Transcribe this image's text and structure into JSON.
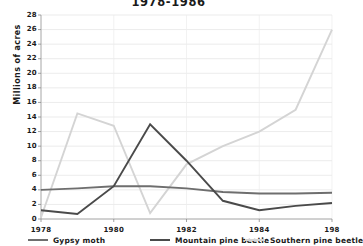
{
  "chart_data": {
    "type": "line",
    "title": "1978-1986",
    "xlabel": "",
    "ylabel": "Millions of acres",
    "x": [
      1978,
      1979,
      1980,
      1981,
      1982,
      1983,
      1984,
      1985,
      1986
    ],
    "xtick_labels": [
      "1978",
      "1980",
      "1982",
      "1984",
      "198"
    ],
    "xtick_values": [
      1978,
      1980,
      1982,
      1984,
      1986
    ],
    "xlim": [
      1978,
      1986
    ],
    "ylim": [
      0,
      28
    ],
    "ytick_labels": [
      "28",
      "26",
      "24",
      "22",
      "20",
      "18",
      "16",
      "14",
      "12",
      "10",
      "8",
      "6",
      "4",
      "2",
      "0"
    ],
    "ytick_values": [
      28,
      26,
      24,
      22,
      20,
      18,
      16,
      14,
      12,
      10,
      8,
      6,
      4,
      2,
      0
    ],
    "grid": true,
    "legend_position": "bottom",
    "series": [
      {
        "name": "Gypsy moth",
        "color": "#6e6e6e",
        "values": [
          4.0,
          4.2,
          4.5,
          4.5,
          4.2,
          3.7,
          3.5,
          3.5,
          3.6
        ]
      },
      {
        "name": "Mountain pine beetle",
        "color": "#4a4a4a",
        "values": [
          1.2,
          0.7,
          4.5,
          13.0,
          8.0,
          2.5,
          1.2,
          1.8,
          2.2
        ]
      },
      {
        "name": "Southern pine beetle",
        "color": "#d4d4d4",
        "values": [
          0.2,
          14.5,
          12.8,
          0.8,
          7.5,
          10.0,
          12.0,
          15.0,
          26.0
        ]
      }
    ]
  },
  "legend": {
    "items": [
      {
        "label": "Gypsy moth",
        "color": "#6e6e6e"
      },
      {
        "label": "Mountain pine beetle",
        "color": "#4a4a4a"
      },
      {
        "label": "Southern pine beetle",
        "color": "#d4d4d4"
      }
    ]
  }
}
